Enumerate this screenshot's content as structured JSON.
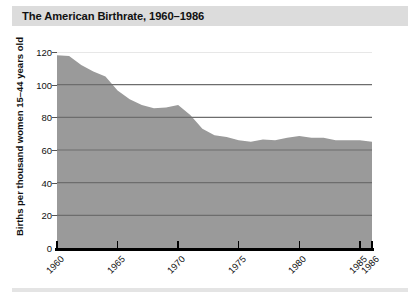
{
  "title": "The American Birthrate, 1960–1986",
  "colors": {
    "title_bar": "#dcdcdc",
    "area_fill": "#9a9a9a",
    "gridline": "#6d6d6d",
    "axis": "#000000",
    "footer_rule": "#e4e4e4"
  },
  "axis": {
    "y_title": "Births per thousand women 15–44 years old",
    "y_ticks": [
      "0",
      "20",
      "40",
      "60",
      "80",
      "100",
      "120"
    ],
    "x_ticks": [
      "1960",
      "1965",
      "1970",
      "1975",
      "1980",
      "1985",
      "1986"
    ]
  },
  "chart_data": {
    "type": "area",
    "title": "The American Birthrate, 1960–1986",
    "xlabel": "",
    "ylabel": "Births per thousand women 15–44 years old",
    "xlim": [
      1960,
      1986
    ],
    "ylim": [
      0,
      120
    ],
    "grid": true,
    "legend": "none",
    "x": [
      1960,
      1961,
      1962,
      1963,
      1964,
      1965,
      1966,
      1967,
      1968,
      1969,
      1970,
      1971,
      1972,
      1973,
      1974,
      1975,
      1976,
      1977,
      1978,
      1979,
      1980,
      1981,
      1982,
      1983,
      1984,
      1985,
      1986
    ],
    "values": [
      118,
      117.5,
      112,
      108,
      105,
      96.5,
      91,
      87.5,
      85.5,
      86,
      87.5,
      81.5,
      73,
      69,
      68,
      66,
      65,
      66.5,
      66,
      67.5,
      68.5,
      67.5,
      67.5,
      66,
      66,
      66,
      65
    ],
    "y_ticks": [
      0,
      20,
      40,
      60,
      80,
      100,
      120
    ],
    "x_tick_labels": [
      "1960",
      "1965",
      "1970",
      "1975",
      "1980",
      "1985",
      "1986"
    ],
    "x_tick_values": [
      1960,
      1965,
      1970,
      1975,
      1980,
      1985,
      1986
    ]
  }
}
